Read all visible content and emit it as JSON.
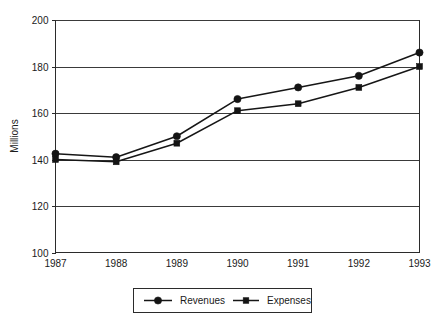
{
  "chart_data": {
    "type": "line",
    "title": "",
    "subtitle": "",
    "xlabel": "",
    "ylabel": "Millions",
    "categories": [
      "1987",
      "1988",
      "1989",
      "1990",
      "1991",
      "1992",
      "1993"
    ],
    "x": [
      1987,
      1988,
      1989,
      1990,
      1991,
      1992,
      1993
    ],
    "series": [
      {
        "name": "Revenues",
        "marker": "circle",
        "color": "#141414",
        "values": [
          142.5,
          141,
          150,
          166,
          171,
          176,
          186
        ]
      },
      {
        "name": "Expenses",
        "marker": "square",
        "color": "#141414",
        "values": [
          140,
          139,
          147,
          161,
          164,
          171,
          180
        ]
      }
    ],
    "ylim": [
      100,
      200
    ],
    "yticks": [
      100,
      120,
      140,
      160,
      180,
      200
    ],
    "ytick_labels": [
      "100",
      "120",
      "140",
      "160",
      "180",
      "200"
    ],
    "xtick_labels": [
      "1987",
      "1988",
      "1989",
      "1990",
      "1991",
      "1992",
      "1993"
    ],
    "grid": "horizontal",
    "legend_position": "bottom",
    "legend_entries": [
      "Revenues",
      "Expenses"
    ],
    "background_color": "#ffffff",
    "line_color": "#161616",
    "axis_color": "#2b2b2b"
  },
  "axes": {
    "y_axis_title": "Millions"
  },
  "legend": {
    "items": [
      {
        "label": "Revenues",
        "marker": "circle-marker"
      },
      {
        "label": "Expenses",
        "marker": "square-marker"
      }
    ]
  }
}
